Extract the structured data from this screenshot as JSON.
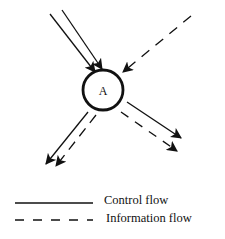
{
  "diagram": {
    "node": {
      "id": "A",
      "label": "A"
    },
    "flows": [
      {
        "name": "control-in-1",
        "type": "control",
        "direction": "in",
        "from": "top-left"
      },
      {
        "name": "control-in-2",
        "type": "control",
        "direction": "in",
        "from": "top-left"
      },
      {
        "name": "information-in",
        "type": "information",
        "direction": "in",
        "from": "top-right"
      },
      {
        "name": "control-out-bottom-left",
        "type": "control",
        "direction": "out",
        "to": "bottom-left"
      },
      {
        "name": "information-out-bottom-left",
        "type": "information",
        "direction": "out",
        "to": "bottom-left"
      },
      {
        "name": "control-out-bottom-right",
        "type": "control",
        "direction": "out",
        "to": "bottom-right"
      },
      {
        "name": "information-out-bottom-right",
        "type": "information",
        "direction": "out",
        "to": "bottom-right"
      }
    ]
  },
  "legend": {
    "items": [
      {
        "style": "solid",
        "label": "Control flow"
      },
      {
        "style": "dashed",
        "label": "Information flow"
      }
    ]
  },
  "colors": {
    "stroke": "#111111",
    "background": "#ffffff"
  }
}
